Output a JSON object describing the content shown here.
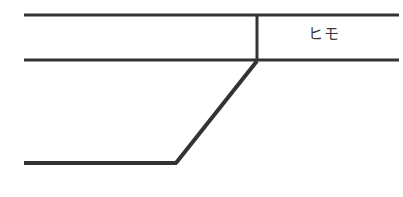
{
  "figure": {
    "background_color": "#ffffff",
    "stroke_color": "#333333",
    "width": 403,
    "height": 197,
    "labels": {
      "himo": "ヒモ"
    },
    "strokes": {
      "top_rail": {
        "name": "top-horizontal-line",
        "x1": 24,
        "y1": 15,
        "x2": 399,
        "y2": 15,
        "width": 3
      },
      "middle_rail": {
        "name": "middle-horizontal-line",
        "x1": 24,
        "y1": 60,
        "x2": 399,
        "y2": 60,
        "width": 3
      },
      "vertical_divider": {
        "name": "vertical-divider-line",
        "x1": 257,
        "y1": 14,
        "x2": 257,
        "y2": 61,
        "width": 3
      },
      "diagonal": {
        "name": "diagonal-line",
        "x1": 176,
        "y1": 163,
        "x2": 257,
        "y2": 61,
        "width": 4
      },
      "bottom_rail": {
        "name": "bottom-horizontal-line",
        "x1": 24,
        "y1": 163,
        "x2": 177,
        "y2": 163,
        "width": 4
      }
    }
  }
}
